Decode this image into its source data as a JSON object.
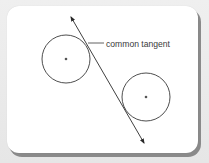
{
  "diagram": {
    "type": "geometry",
    "colors": {
      "background": "#ebebeb",
      "card": "#ffffff",
      "card_shadow": "#8a8a8a",
      "stroke": "#3a3a3a",
      "center_dot": "#555555"
    },
    "circles": [
      {
        "name": "left-circle",
        "cx": 66,
        "cy": 59,
        "r": 24
      },
      {
        "name": "right-circle",
        "cx": 146,
        "cy": 97,
        "r": 24
      }
    ],
    "tangent_line": {
      "x1": 71,
      "y1": 17,
      "x2": 144,
      "y2": 143,
      "arrows": "both"
    },
    "label": {
      "text": "common tangent",
      "x": 106,
      "y": 47,
      "leader": {
        "x1": 88,
        "y1": 43,
        "x2": 104,
        "y2": 43
      }
    }
  }
}
